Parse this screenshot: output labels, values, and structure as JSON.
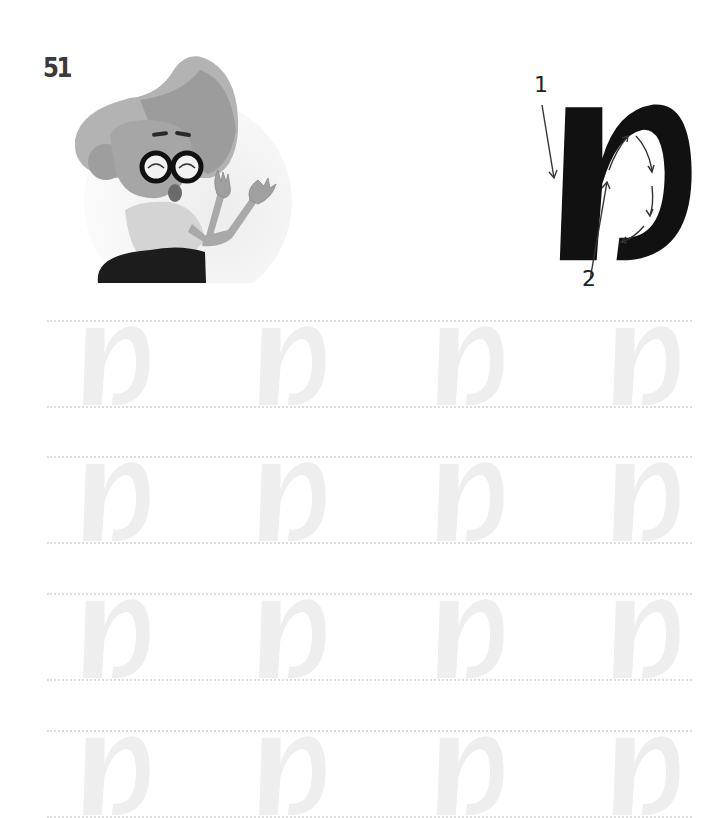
{
  "page": {
    "number": "51"
  },
  "illustration": {
    "subject": "cheerful woman with glasses waving",
    "colors": {
      "hair_light": "#b4b4b4",
      "hair_dark": "#999999",
      "skin": "#a9a9a9",
      "shirt": "#d6d6d6",
      "skirt": "#1c1c1c",
      "glasses": "#111111",
      "circle_bg": "#ececec"
    }
  },
  "model_letter": {
    "letter": "מ",
    "name": "mem (cursive)",
    "color": "#111111",
    "stroke_order": [
      {
        "num": "1",
        "direction": "down along left stem"
      },
      {
        "num": "2",
        "direction": "up then around the bowl"
      }
    ]
  },
  "practice": {
    "letter": "מ",
    "trace_color": "#eeeeee",
    "guide_line_color": "#dcdcdc",
    "rows": [
      {
        "letters": [
          "מ",
          "מ",
          "מ",
          "מ"
        ]
      },
      {
        "letters": [
          "מ",
          "מ",
          "מ",
          "מ"
        ]
      },
      {
        "letters": [
          "מ",
          "מ",
          "מ",
          "מ"
        ]
      },
      {
        "letters": [
          "מ",
          "מ",
          "מ",
          "מ"
        ]
      }
    ]
  }
}
